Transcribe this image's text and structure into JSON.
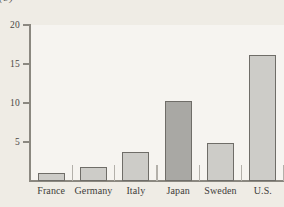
{
  "caption_fragment": "(b)",
  "chart_data": {
    "type": "bar",
    "title": "",
    "subtitle": "",
    "xlabel": "",
    "ylabel": "",
    "categories": [
      "France",
      "Germany",
      "Italy",
      "Japan",
      "Sweden",
      "U.S."
    ],
    "values": [
      1.0,
      1.8,
      3.7,
      10.3,
      4.9,
      16.1
    ],
    "ylim": [
      0,
      20
    ],
    "ytick_labels": [
      "5",
      "10",
      "15",
      "20"
    ],
    "yticks": [
      5,
      10,
      15,
      20
    ],
    "grid": false,
    "legend": null,
    "series": [
      {
        "name": "value",
        "values": [
          1.0,
          1.8,
          3.7,
          10.3,
          4.9,
          16.1
        ]
      }
    ],
    "bar_colors": [
      "#cdccc8",
      "#cdccc8",
      "#cdccc8",
      "#a9a8a4",
      "#cdccc8",
      "#cdccc8"
    ],
    "bar_border_color": "#6f6d68",
    "highlighted_category": "Japan",
    "plot_background": "#f6f4f0",
    "page_background": "#efece5",
    "axis_color": "#8b8880"
  }
}
